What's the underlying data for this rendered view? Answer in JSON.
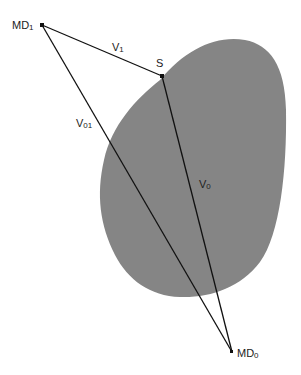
{
  "diagram": {
    "colors": {
      "region_fill": "#858585",
      "line": "#111111",
      "text": "#222222",
      "background": "#ffffff"
    },
    "region": {
      "name": "shaded-region",
      "description": "gray irregular blob"
    },
    "points": {
      "md1": {
        "label": "MD",
        "subscript": "1",
        "x": 42,
        "y": 25
      },
      "s": {
        "label": "S",
        "subscript": "",
        "x": 162,
        "y": 76
      },
      "md0": {
        "label": "MD",
        "subscript": "0",
        "x": 232,
        "y": 352
      }
    },
    "vectors": {
      "v1": {
        "label": "V",
        "subscript": "1",
        "from": "md1",
        "to": "s"
      },
      "v0": {
        "label": "V",
        "subscript": "0",
        "from": "s",
        "to": "md0"
      },
      "v01": {
        "label": "V",
        "subscript": "01",
        "from": "md1",
        "to": "md0"
      }
    }
  }
}
